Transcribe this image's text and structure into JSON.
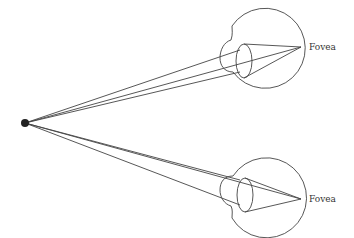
{
  "diagram": {
    "labels": {
      "upper_fovea": "Fovea",
      "lower_fovea": "Fovea"
    },
    "elements": [
      "fixation-point",
      "upper-eye",
      "lower-eye",
      "light-rays"
    ]
  }
}
